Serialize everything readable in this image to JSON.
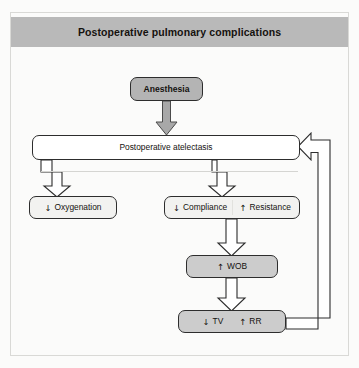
{
  "figure": {
    "title": "Postoperative pulmonary complications",
    "background_color": "#fbfbfa",
    "header_color": "#b9b9b9",
    "border_color": "#d9d9d6"
  },
  "nodes": {
    "anesthesia": {
      "label": "Anesthesia",
      "fill": "#b4b4b4"
    },
    "atelectasis": {
      "label": "Postoperative atelectasis",
      "fill": "#ffffff"
    },
    "oxygenation": {
      "arrow": "↓",
      "label": "Oxygenation",
      "fill": "#f2f2f0"
    },
    "compliance": {
      "arrow": "↓",
      "label": "Compliance",
      "fill": "#f2f2f0"
    },
    "resistance": {
      "arrow": "↑",
      "label": "Resistance",
      "fill": "#f2f2f0"
    },
    "wob": {
      "arrow": "↑",
      "label": "WOB",
      "fill": "#cccccc"
    },
    "tv": {
      "arrow": "↓",
      "label": "TV",
      "fill": "#cccccc"
    },
    "rr": {
      "arrow": "↑",
      "label": "RR",
      "fill": "#cccccc"
    }
  },
  "connectors": {
    "anesthesia_to_atelectasis": "filled-down-arrow",
    "atelectasis_to_oxygenation": "outline-down-arrow",
    "atelectasis_to_compliance_resistance": "outline-down-arrow",
    "compliance_resistance_to_wob": "outline-down-arrow",
    "wob_to_tv_rr": "outline-down-arrow",
    "tv_rr_feedback_to_atelectasis": "outline-loop-arrow-left"
  }
}
